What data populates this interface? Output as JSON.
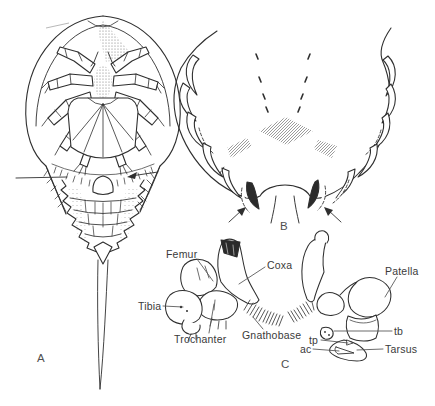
{
  "figure": {
    "panels": {
      "a": "A",
      "b": "B",
      "c": "C"
    },
    "leg_labels": {
      "femur": "Femur",
      "coxa": "Coxa",
      "patella": "Patella",
      "tibia": "Tibia",
      "trochanter": "Trochanter",
      "gnathobase": "Gnathobase",
      "tp": "tp",
      "ac": "ac",
      "tb": "tb",
      "tarsus": "Tarsus"
    },
    "colors": {
      "ink": "#2f2f2f",
      "background": "#ffffff",
      "label_text": "#3a3a3a"
    }
  }
}
